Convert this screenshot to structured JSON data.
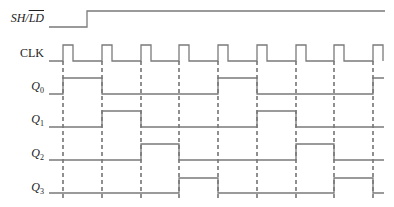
{
  "colors": {
    "signal": "#7a7a7a",
    "dashed": "#555555",
    "text": "#222222"
  },
  "labels": {
    "sh_ld_main": "SH/",
    "sh_ld_overline": "LD",
    "clk": "CLK",
    "q0": "Q",
    "q0_sub": "0",
    "q1": "Q",
    "q1_sub": "1",
    "q2": "Q",
    "q2_sub": "2",
    "q3": "Q",
    "q3_sub": "3"
  },
  "clock_edges_x": [
    63,
    102,
    141,
    179,
    218,
    257,
    296,
    334,
    373
  ],
  "signals": {
    "sh_ld": {
      "high_y": 11,
      "low_y": 27,
      "start_x": 49,
      "end_x": 385,
      "transitions": [
        87
      ],
      "initial": 0
    },
    "clk": {
      "high_y": 45,
      "low_y": 61,
      "start_x": 49,
      "end_x": 384,
      "pulse_width": 10
    },
    "q0": {
      "high_y": 78,
      "low_y": 94,
      "start_x": 49,
      "end_x": 384,
      "transitions": [
        63,
        102,
        218,
        257,
        373
      ],
      "initial": 0
    },
    "q1": {
      "high_y": 111,
      "low_y": 127,
      "start_x": 49,
      "end_x": 384,
      "transitions": [
        102,
        141,
        257,
        296
      ],
      "initial": 0
    },
    "q2": {
      "high_y": 144,
      "low_y": 160,
      "start_x": 49,
      "end_x": 384,
      "transitions": [
        141,
        179,
        296,
        334
      ],
      "initial": 0
    },
    "q3": {
      "high_y": 178,
      "low_y": 193,
      "start_x": 49,
      "end_x": 384,
      "transitions": [
        179,
        218,
        334,
        373
      ],
      "initial": 0
    }
  }
}
